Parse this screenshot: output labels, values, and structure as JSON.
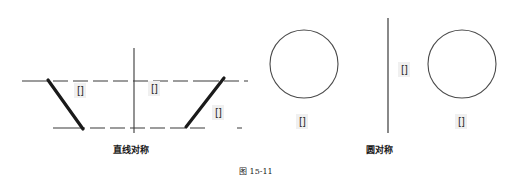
{
  "figure": {
    "number": "图 15-11",
    "number_x": 239,
    "number_y": 165
  },
  "panels": [
    {
      "id": "line-symmetry",
      "caption": "直线对称",
      "caption_x": 113,
      "caption_y": 143,
      "axis": {
        "type": "vertical-mirror-axis",
        "x": 134,
        "y1": 48,
        "y2": 133
      },
      "guide_lines": [
        {
          "name": "upper-guide-line",
          "x1": 22,
          "y1": 81,
          "x2": 248,
          "y2": 81,
          "style": "dashed"
        },
        {
          "name": "lower-guide-line",
          "x1": 53,
          "y1": 128,
          "x2": 248,
          "y2": 128,
          "style": "dashed"
        }
      ],
      "shapes": [
        {
          "name": "original-diagonal",
          "x1": 48,
          "y1": 80,
          "x2": 83,
          "y2": 129
        },
        {
          "name": "mirrored-diagonal",
          "x1": 186,
          "y1": 127,
          "x2": 224,
          "y2": 78
        }
      ],
      "labels": [
        {
          "text": "[]",
          "x": 74,
          "y": 83
        },
        {
          "text": "[]",
          "x": 148,
          "y": 81
        },
        {
          "text": "[]",
          "x": 212,
          "y": 105
        }
      ]
    },
    {
      "id": "circle-original",
      "circle": {
        "name": "source-circle",
        "cx": 304,
        "cy": 64,
        "r": 34
      },
      "labels": [
        {
          "text": "[]",
          "x": 296,
          "y": 114
        }
      ]
    },
    {
      "id": "circle-symmetry",
      "caption": "圆对称",
      "caption_x": 366,
      "caption_y": 143,
      "axis": {
        "type": "vertical-mirror-axis",
        "x": 388,
        "y1": 18,
        "y2": 133
      },
      "circle": {
        "name": "mirrored-circle",
        "cx": 462,
        "cy": 64,
        "r": 34
      },
      "labels": [
        {
          "text": "[]",
          "x": 398,
          "y": 62
        },
        {
          "text": "[]",
          "x": 455,
          "y": 114
        }
      ]
    }
  ],
  "colors": {
    "stroke": "#1a1a1a",
    "guide": "#3a3a3a",
    "circle": "#4a4a4a",
    "label_bg": "#f0f0f0",
    "background": "#ffffff"
  }
}
